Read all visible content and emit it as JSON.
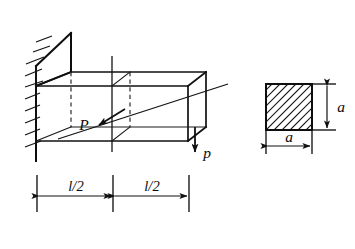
{
  "figure": {
    "kind": "engineering-mechanics-diagram",
    "ink_color": "#101010",
    "background_color": "#ffffff"
  },
  "beam": {
    "support_label": "fixed-wall-hatching",
    "axial_load_label": "P",
    "tip_load_label": "p",
    "span_left_label": "l/2",
    "span_right_label": "l/2"
  },
  "cross_section": {
    "title_glyph": "square-hatched-section",
    "height_label": "a",
    "width_label": "a"
  },
  "dimensions": {
    "segments": [
      {
        "label": "l/2"
      },
      {
        "label": "l/2"
      }
    ]
  }
}
